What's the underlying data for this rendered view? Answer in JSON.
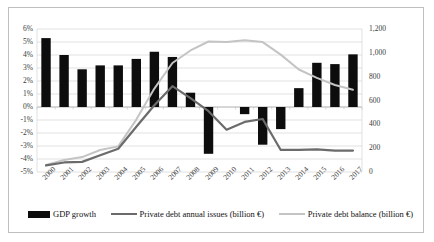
{
  "chart_data": {
    "type": "bar",
    "title": "",
    "subtitle": "",
    "xlabel": "",
    "ylabel": "",
    "y2label": "",
    "grid": true,
    "legend_position": "bottom",
    "categories": [
      "2000",
      "2001",
      "2002",
      "2003",
      "2004",
      "2005",
      "2006",
      "2007",
      "2008",
      "2009",
      "2010",
      "2011",
      "2012",
      "2013",
      "2014",
      "2015",
      "2016",
      "2017"
    ],
    "ylim": [
      -5,
      6
    ],
    "yticks": [
      "6%",
      "5%",
      "4%",
      "3%",
      "2%",
      "1%",
      "0%",
      "-1%",
      "-2%",
      "-3%",
      "-4%",
      "-5%"
    ],
    "ytick_values": [
      6,
      5,
      4,
      3,
      2,
      1,
      0,
      -1,
      -2,
      -3,
      -4,
      -5
    ],
    "y2lim": [
      0,
      1200
    ],
    "y2ticks": [
      "1,200",
      "1,000",
      "800",
      "600",
      "400",
      "200",
      "0"
    ],
    "y2tick_values": [
      1200,
      1000,
      800,
      600,
      400,
      200,
      0
    ],
    "series": [
      {
        "name": "GDP growth",
        "type": "bar",
        "axis": "left",
        "unit": "%",
        "color": "#0d0d0d",
        "values": [
          5.3,
          4.0,
          2.9,
          3.2,
          3.2,
          3.7,
          4.25,
          3.85,
          1.1,
          -3.6,
          0.0,
          -0.55,
          -2.9,
          -1.7,
          1.45,
          3.4,
          3.3,
          4.05
        ]
      },
      {
        "name": "Private debt annual issues (billion €)",
        "type": "line",
        "axis": "right",
        "unit": "billion €",
        "color": "#6b6b6b",
        "values": [
          55,
          80,
          85,
          140,
          195,
          380,
          560,
          720,
          620,
          510,
          355,
          420,
          445,
          185,
          185,
          190,
          180,
          180
        ]
      },
      {
        "name": "Private debt balance (billion €)",
        "type": "line",
        "axis": "right",
        "unit": "billion €",
        "color": "#c4c4c4",
        "values": [
          60,
          100,
          125,
          185,
          215,
          440,
          700,
          915,
          1020,
          1095,
          1090,
          1105,
          1090,
          985,
          860,
          790,
          730,
          690
        ]
      }
    ]
  },
  "legend": {
    "items": [
      {
        "label": "GDP growth",
        "marker": "bar-swatch"
      },
      {
        "label": "Private debt annual issues (billion €)",
        "marker": "line-swatch-dark"
      },
      {
        "label": "Private debt balance (billion €)",
        "marker": "line-swatch-light"
      }
    ]
  }
}
